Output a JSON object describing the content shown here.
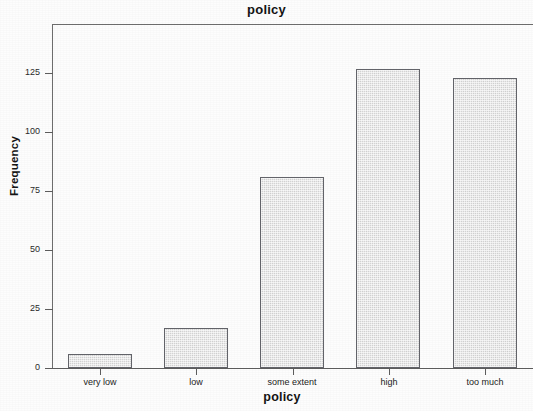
{
  "chart_data": {
    "type": "bar",
    "title": "policy",
    "xlabel": "policy",
    "ylabel": "Frequency",
    "categories": [
      "very low",
      "low",
      "some extent",
      "high",
      "too much"
    ],
    "values": [
      6,
      17,
      81,
      127,
      123
    ],
    "series": [
      {
        "name": "Frequency",
        "values": [
          6,
          17,
          81,
          127,
          123
        ]
      }
    ],
    "ylim": [
      0,
      146
    ],
    "yticks": [
      0,
      25,
      50,
      75,
      100,
      125
    ],
    "ytick_labels": [
      "0",
      "25",
      "50",
      "75",
      "100",
      "125"
    ],
    "grid": false,
    "legend": false,
    "bar_fill_color": "#e6e6e6",
    "bar_edge_color": "#63646a",
    "axis_color": "#5d5d5d",
    "background_color": "#fdfdfd"
  }
}
